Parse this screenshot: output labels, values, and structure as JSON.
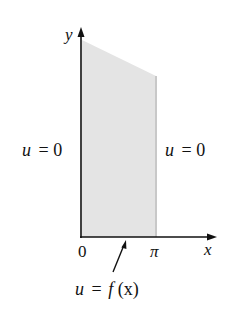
{
  "diagram": {
    "type": "boundary-value-problem-region",
    "colors": {
      "background": "#ffffff",
      "region_fill": "#e4e4e4",
      "region_right_edge": "#c8c8c8",
      "axis": "#111111",
      "text": "#111111"
    },
    "axes": {
      "x_label": "x",
      "y_label": "y",
      "origin_label": "0",
      "pi_label": "π"
    },
    "boundary_labels": {
      "left": {
        "var": "u",
        "eq": "= 0"
      },
      "right": {
        "var": "u",
        "eq": "= 0"
      },
      "bottom": {
        "var": "u",
        "eq": "=",
        "func": "f",
        "arg": "(x)"
      }
    }
  }
}
